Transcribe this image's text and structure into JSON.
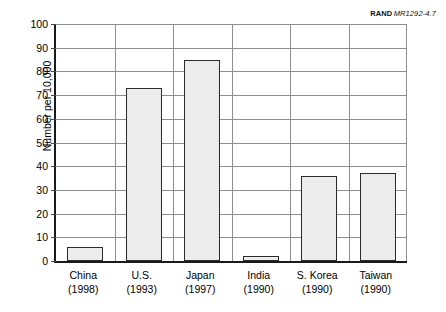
{
  "attribution": {
    "mark": "RAND",
    "doc_id": "MR1292-4.7"
  },
  "chart_data": {
    "type": "bar",
    "title": "",
    "subtitle": "",
    "xlabel": "",
    "ylabel": "Number per 10,000",
    "ylim": [
      0,
      100
    ],
    "ytick_step": 10,
    "ytick_labels": [
      "0",
      "10",
      "20",
      "30",
      "40",
      "50",
      "60",
      "70",
      "80",
      "90",
      "100"
    ],
    "grid": "horizontal",
    "legend": "none",
    "categories": [
      "China\n(1998)",
      "U.S.\n(1993)",
      "Japan\n(1997)",
      "India\n(1990)",
      "S. Korea\n(1990)",
      "Taiwan\n(1990)"
    ],
    "category_names": [
      "China",
      "U.S.",
      "Japan",
      "India",
      "S. Korea",
      "Taiwan"
    ],
    "category_years": [
      "(1998)",
      "(1993)",
      "(1997)",
      "(1990)",
      "(1990)",
      "(1990)"
    ],
    "values": [
      6,
      73,
      85,
      2,
      36,
      37
    ],
    "colors": {
      "bar_fill": "#ececec",
      "bar_stroke": "#2b2b2b",
      "grid": "#8e8e8e",
      "axis": "#1a1a1a",
      "text": "#000000"
    }
  }
}
